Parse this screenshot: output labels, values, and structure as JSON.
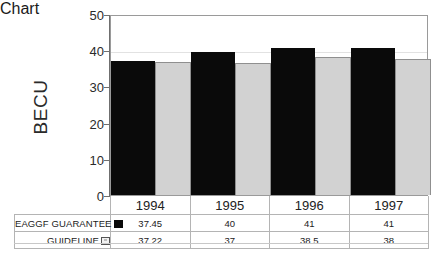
{
  "chart_data": {
    "type": "bar",
    "title": "",
    "xlabel": "",
    "ylabel": "BECU",
    "ylim": [
      0,
      50
    ],
    "ytick_values": [
      50,
      40,
      30,
      20,
      10,
      0
    ],
    "grid": true,
    "legend_position": "data-table-row-labels",
    "categories": [
      "1994",
      "1995",
      "1996",
      "1997"
    ],
    "series": [
      {
        "name": "EAGGF GUARANTEE",
        "color": "#0a0a0a",
        "marker": "filled-square",
        "values": [
          37.45,
          40,
          41,
          41
        ],
        "value_labels": [
          "37.45",
          "40",
          "41",
          "41"
        ]
      },
      {
        "name": "GUIDELINE",
        "color": "#d2d2d2",
        "marker": "hollow-square",
        "values": [
          37.22,
          37,
          38.5,
          38
        ],
        "value_labels": [
          "37.22",
          "37",
          "38.5",
          "38"
        ]
      }
    ]
  },
  "axis": {
    "y_title": "BECU",
    "ticks": [
      "50",
      "40",
      "30",
      "20",
      "10",
      "0"
    ]
  },
  "table": {
    "years": [
      "1994",
      "1995",
      "1996",
      "1997"
    ],
    "rows": [
      {
        "label": "EAGGF GUARANTEE",
        "marker": "filled-square",
        "values": [
          "37.45",
          "40",
          "41",
          "41"
        ]
      },
      {
        "label": "GUIDELINE",
        "marker": "hollow-square",
        "values": [
          "37.22",
          "37",
          "38.5",
          "38"
        ]
      }
    ]
  },
  "colors": {
    "series_1": "#0a0a0a",
    "series_2": "#d2d2d2",
    "frame": "#9a9a9a",
    "grid": "#e2e2e2",
    "table_border": "#b4b4b4",
    "background": "#ffffff"
  }
}
